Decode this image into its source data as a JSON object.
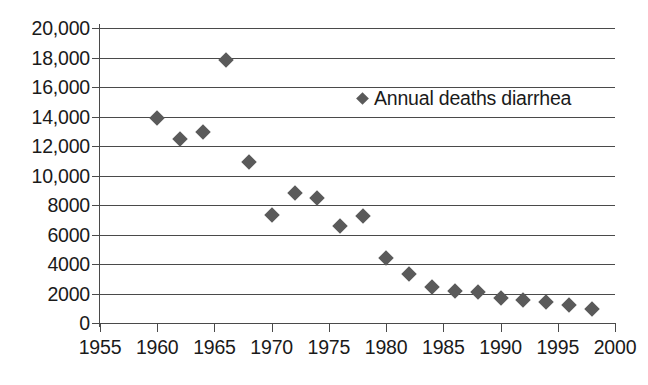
{
  "chart_data": {
    "type": "scatter",
    "title": "",
    "xlabel": "",
    "ylabel": "",
    "xlim": [
      1955,
      2000
    ],
    "ylim": [
      0,
      20000
    ],
    "grid": true,
    "legend_position": "inside-top-right",
    "marker": "diamond",
    "marker_color": "#5a5a5a",
    "axis_color": "#4a4a4a",
    "series": [
      {
        "name": "Annual deaths diarrhea",
        "x": [
          1960,
          1962,
          1964,
          1966,
          1968,
          1970,
          1972,
          1974,
          1976,
          1978,
          1980,
          1982,
          1984,
          1986,
          1988,
          1990,
          1992,
          1994,
          1996,
          1998
        ],
        "values": [
          13900,
          12450,
          12950,
          17800,
          10900,
          7300,
          8800,
          8450,
          6600,
          7250,
          4400,
          3350,
          2450,
          2150,
          2100,
          1700,
          1550,
          1400,
          1250,
          950
        ]
      }
    ],
    "y_ticks": [
      0,
      2000,
      4000,
      6000,
      8000,
      10000,
      12000,
      14000,
      16000,
      18000,
      20000
    ],
    "y_tick_labels": [
      "0",
      "2000",
      "4000",
      "6000",
      "8000",
      "10,000",
      "12,000",
      "14,000",
      "16,000",
      "18,000",
      "20,000"
    ],
    "x_ticks": [
      1955,
      1960,
      1965,
      1970,
      1975,
      1980,
      1985,
      1990,
      1995,
      2000
    ],
    "x_tick_labels": [
      "1955",
      "1960",
      "1965",
      "1970",
      "1975",
      "1980",
      "1985",
      "1990",
      "1995",
      "2000"
    ]
  },
  "legend": {
    "label": "Annual deaths diarrhea"
  }
}
